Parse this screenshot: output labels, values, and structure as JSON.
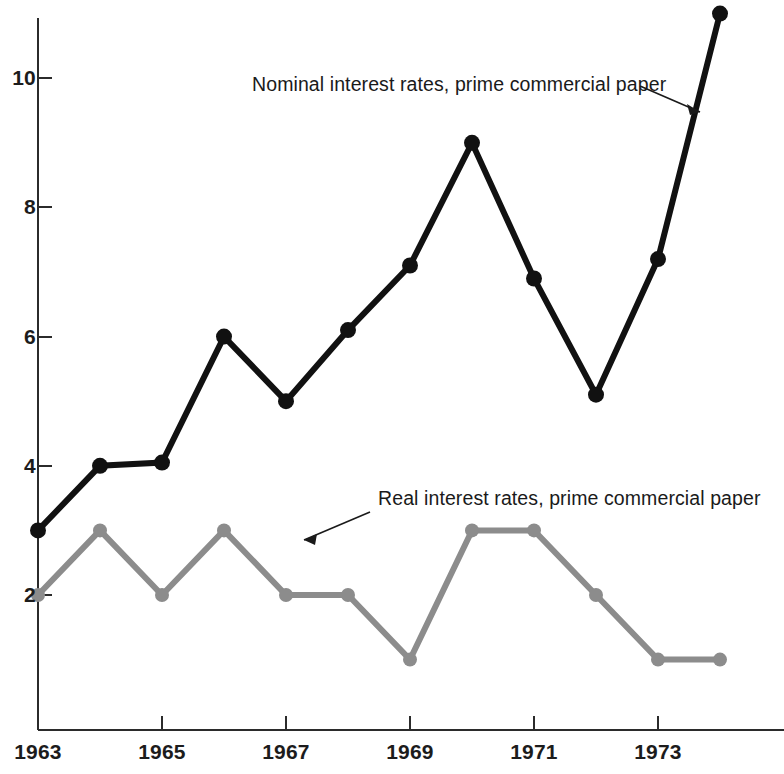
{
  "chart_data": {
    "type": "line",
    "title": "",
    "subtitle": "",
    "xlabel": "",
    "ylabel": "",
    "x": [
      1963,
      1964,
      1965,
      1966,
      1967,
      1968,
      1969,
      1970,
      1971,
      1972,
      1973,
      1974
    ],
    "xlim": [
      1963,
      1974.6
    ],
    "ylim": [
      0,
      11.6
    ],
    "grid": false,
    "legend_position": "inline-annotations",
    "y_ticks": [
      2,
      4,
      6,
      8,
      10
    ],
    "y_tick_labels": [
      "2",
      "4",
      "6",
      "8",
      "10"
    ],
    "x_ticks": [
      1963,
      1965,
      1967,
      1969,
      1971,
      1973
    ],
    "x_tick_labels": [
      "1963",
      "1965",
      "1967",
      "1969",
      "1971",
      "1973"
    ],
    "series": [
      {
        "name": "Nominal interest rates, prime commercial paper",
        "color": "#111111",
        "values": [
          3.0,
          4.0,
          4.05,
          6.0,
          5.0,
          6.1,
          7.1,
          9.0,
          6.9,
          5.1,
          7.2,
          11.0
        ]
      },
      {
        "name": "Real interest rates, prime commercial paper",
        "color": "#8c8c8c",
        "values": [
          2.0,
          3.0,
          2.0,
          3.0,
          2.0,
          2.0,
          1.0,
          3.0,
          3.0,
          2.0,
          1.0,
          1.0
        ]
      }
    ],
    "annotations": [
      {
        "text": "Nominal interest rates, prime commercial paper",
        "target_x": 1974,
        "target_y": 9.6
      },
      {
        "text": "Real interest rates, prime commercial paper",
        "target_x": 1966.35,
        "target_y": 2.75
      }
    ]
  },
  "axes": {
    "y_labels": [
      "10",
      "8",
      "6",
      "4",
      "2"
    ],
    "x_labels": [
      "1963",
      "1965",
      "1967",
      "1969",
      "1971",
      "1973"
    ]
  },
  "labels": {
    "nominal": "Nominal interest rates, prime commercial paper",
    "real": "Real interest rates, prime commercial paper"
  },
  "colors": {
    "nominal": "#111111",
    "real": "#8c8c8c",
    "axis": "#2b2b2b",
    "background": "#ffffff"
  }
}
